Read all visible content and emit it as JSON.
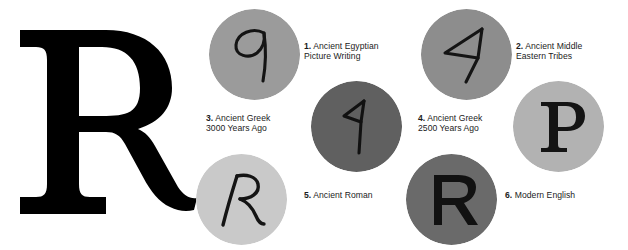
{
  "figure": {
    "title_letter": "R",
    "hero": {
      "glyph_name": "bold-serif-capital-R",
      "color": "#000000"
    },
    "background_color": "#ffffff",
    "text_color": "#1b1b1b"
  },
  "stages": [
    {
      "number": "1.",
      "line1": "Ancient Egyptian",
      "line2": "Picture Writing",
      "glyph_name": "egyptian-head-glyph",
      "glyph_char": "q",
      "circle_color": "#9b9b9b",
      "glyph_color": "#141414"
    },
    {
      "number": "2.",
      "line1": "Ancient Middle",
      "line2": "Eastern Tribes",
      "glyph_name": "semitic-resh-triangle-glyph",
      "glyph_char": "4",
      "circle_color": "#8d8d8d",
      "glyph_color": "#141414"
    },
    {
      "number": "3.",
      "line1": "Ancient Greek",
      "line2": "3000 Years Ago",
      "glyph_name": "archaic-greek-rho-glyph",
      "glyph_char": "9",
      "circle_color": "#606060",
      "glyph_color": "#111111"
    },
    {
      "number": "4.",
      "line1": "Ancient Greek",
      "line2": "2500 Years Ago",
      "glyph_name": "greek-capital-rho-glyph",
      "glyph_char": "P",
      "circle_color": "#b2b2b2",
      "glyph_color": "#141414"
    },
    {
      "number": "5.",
      "line1": "Ancient Roman",
      "line2": "",
      "glyph_name": "roman-cursive-r-glyph",
      "glyph_char": "R",
      "circle_color": "#c9c9c9",
      "glyph_color": "#141414"
    },
    {
      "number": "6.",
      "line1": "Modern English",
      "line2": "",
      "glyph_name": "modern-sans-capital-r-glyph",
      "glyph_char": "R",
      "circle_color": "#6a6a6a",
      "glyph_color": "#111111"
    }
  ]
}
